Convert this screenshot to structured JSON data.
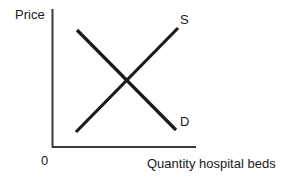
{
  "figure": {
    "background_color": "#ffffff",
    "stroke_color": "#1a1a1a",
    "width": 297,
    "height": 180
  },
  "axes": {
    "y_axis_label": "Price",
    "x_axis_label": "Quantity hospital beds",
    "origin_label": "0"
  },
  "curves": {
    "supply_label": "S",
    "demand_label": "D"
  },
  "chart_data": {
    "type": "line",
    "title": "",
    "subtitle": "",
    "xlabel": "Quantity hospital beds",
    "ylabel": "Price",
    "origin_label": "0",
    "grid": false,
    "legend": "inline-curve-labels",
    "xlim": [
      0,
      100
    ],
    "ylim": [
      0,
      100
    ],
    "axis_ticks": {
      "x": [],
      "y": []
    },
    "series": [
      {
        "name": "S",
        "label": "S",
        "description": "Upward sloping supply curve",
        "color": "#1a1a1a",
        "line_width": 3,
        "points": [
          {
            "x": 17,
            "y": 11
          },
          {
            "x": 87,
            "y": 86
          }
        ],
        "pixel_points": [
          {
            "x": 76,
            "y": 132
          },
          {
            "x": 178,
            "y": 28
          }
        ],
        "label_position": {
          "x": 180,
          "y": 13
        }
      },
      {
        "name": "D",
        "label": "D",
        "description": "Downward sloping demand curve",
        "color": "#1a1a1a",
        "line_width": 3,
        "points": [
          {
            "x": 17,
            "y": 84
          },
          {
            "x": 86,
            "y": 12
          }
        ],
        "pixel_points": [
          {
            "x": 77,
            "y": 30
          },
          {
            "x": 176,
            "y": 130
          }
        ],
        "label_position": {
          "x": 180,
          "y": 115
        }
      }
    ],
    "annotations": [
      {
        "name": "equilibrium-intersection",
        "description": "Supply and demand curves cross",
        "pixel_x": 127,
        "pixel_y": 81
      }
    ]
  }
}
